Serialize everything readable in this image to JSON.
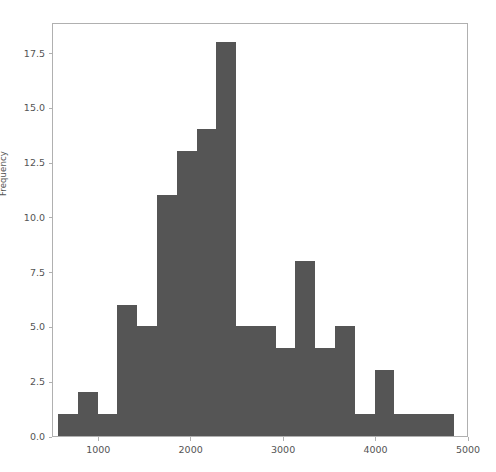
{
  "chart_data": {
    "type": "bar",
    "chart_subtype": "histogram",
    "title": "",
    "xlabel": "",
    "ylabel": "Frequency",
    "grid": false,
    "legend": null,
    "xlim": [
      500,
      5000
    ],
    "ylim": [
      0,
      18.9
    ],
    "xticks": [
      1000,
      2000,
      3000,
      4000,
      5000
    ],
    "xtick_labels": [
      "1000",
      "2000",
      "3000",
      "4000",
      "5000"
    ],
    "yticks": [
      0.0,
      2.5,
      5.0,
      7.5,
      10.0,
      12.5,
      15.0,
      17.5
    ],
    "ytick_labels": [
      "0.0",
      "2.5",
      "5.0",
      "7.5",
      "10.0",
      "12.5",
      "15.0",
      "17.5"
    ],
    "bar_color": "#555555",
    "bin_edges": [
      555,
      769,
      983,
      1197,
      1411,
      1625,
      1839,
      2053,
      2267,
      2481,
      2695,
      2909,
      3123,
      3337,
      3551,
      3765,
      3979,
      4193,
      4407,
      4621,
      4835
    ],
    "bin_centers": [
      662,
      876,
      1090,
      1304,
      1518,
      1732,
      1946,
      2160,
      2374,
      2588,
      2802,
      3016,
      3230,
      3444,
      3658,
      3872,
      4086,
      4300,
      4514,
      4728
    ],
    "values": [
      1,
      2,
      1,
      6,
      5,
      11,
      13,
      14,
      18,
      5,
      5,
      4,
      8,
      4,
      5,
      1,
      3,
      1,
      1,
      1
    ],
    "bin_count": 20
  }
}
